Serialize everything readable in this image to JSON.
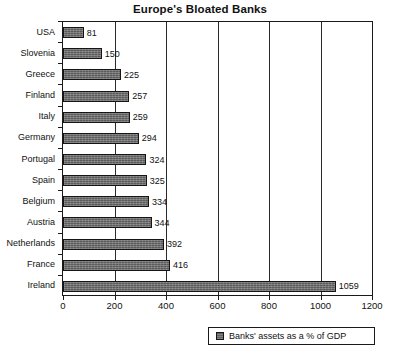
{
  "chart_data": {
    "type": "bar",
    "orientation": "horizontal",
    "title": "Europe's Bloated Banks",
    "xlabel": "",
    "ylabel": "",
    "xlim": [
      0,
      1200
    ],
    "xticks": [
      0,
      200,
      400,
      600,
      800,
      1000,
      1200
    ],
    "grid": "vertical",
    "legend_position": "bottom",
    "categories": [
      "USA",
      "Slovenia",
      "Greece",
      "Finland",
      "Italy",
      "Germany",
      "Portugal",
      "Spain",
      "Belgium",
      "Austria",
      "Netherlands",
      "France",
      "Ireland"
    ],
    "values": [
      81,
      150,
      225,
      257,
      259,
      294,
      324,
      325,
      334,
      344,
      392,
      416,
      1059
    ],
    "data_labels": [
      "81",
      "150",
      "225",
      "257",
      "259",
      "294",
      "324",
      "325",
      "334",
      "344",
      "392",
      "416",
      "1059"
    ],
    "series": [
      {
        "name": "Banks' assets as a % of GDP",
        "values": [
          81,
          150,
          225,
          257,
          259,
          294,
          324,
          325,
          334,
          344,
          392,
          416,
          1059
        ],
        "color": "#6b6b6b"
      }
    ],
    "tick_labels": [
      "0",
      "200",
      "400",
      "600",
      "800",
      "1000",
      "1200"
    ]
  },
  "legend": {
    "label": "Banks' assets as a % of GDP",
    "swatch_color": "#6b6b6b"
  },
  "colors": {
    "bar_fill": "#6b6b6b",
    "bar_outline": "#151515",
    "axis": "#1a1a1a",
    "text": "#111111",
    "background": "#ffffff"
  }
}
